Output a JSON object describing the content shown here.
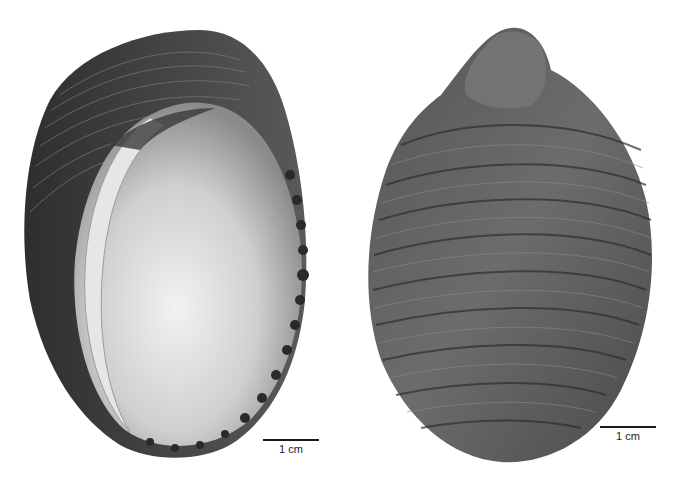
{
  "figure": {
    "views": [
      {
        "id": "aperture",
        "description": "Shell in apertural view, showing smooth white interior and toothed outer lip"
      },
      {
        "id": "dorsal",
        "description": "Shell in dorsal view, showing spiral ribs and low spire"
      }
    ],
    "scale_bars": [
      {
        "label": "1 cm"
      },
      {
        "label": "1 cm"
      }
    ],
    "colors": {
      "background": "#ffffff",
      "shell_dark": "#3a3a3a",
      "shell_mid": "#6a6a6a",
      "interior_light": "#e8e8e8"
    }
  }
}
